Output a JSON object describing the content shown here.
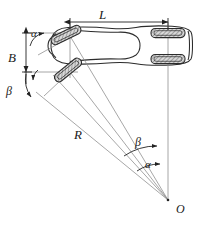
{
  "figure": {
    "type": "engineering-line-diagram",
    "colors": {
      "background": "#ffffff",
      "body_outline": "#2b2b2b",
      "construction_line": "#8a8a8a",
      "dimension_line": "#222222",
      "wheel_fill": "#d9d9d9",
      "wheel_outline": "#2b2b2b",
      "label_text": "#1a1a1a"
    },
    "labels": {
      "wheelbase": "L",
      "track": "B",
      "radius": "R",
      "center": "O",
      "angle_outer_top": "α",
      "angle_inner_left": "β",
      "angle_outer_bottom": "α",
      "angle_inner_bottom": "β"
    },
    "elements": {
      "wheels": [
        {
          "name": "front-outer-wheel",
          "steered": true,
          "angle_deg": -28
        },
        {
          "name": "front-inner-wheel",
          "steered": true,
          "angle_deg": -40
        },
        {
          "name": "rear-outer-wheel",
          "steered": false,
          "angle_deg": 0
        },
        {
          "name": "rear-inner-wheel",
          "steered": false,
          "angle_deg": 0
        }
      ],
      "turn_center_point": {
        "name": "O",
        "x": 168,
        "y": 200
      },
      "radius_line_label": "R",
      "dimension_lines": [
        "L",
        "B"
      ]
    }
  }
}
